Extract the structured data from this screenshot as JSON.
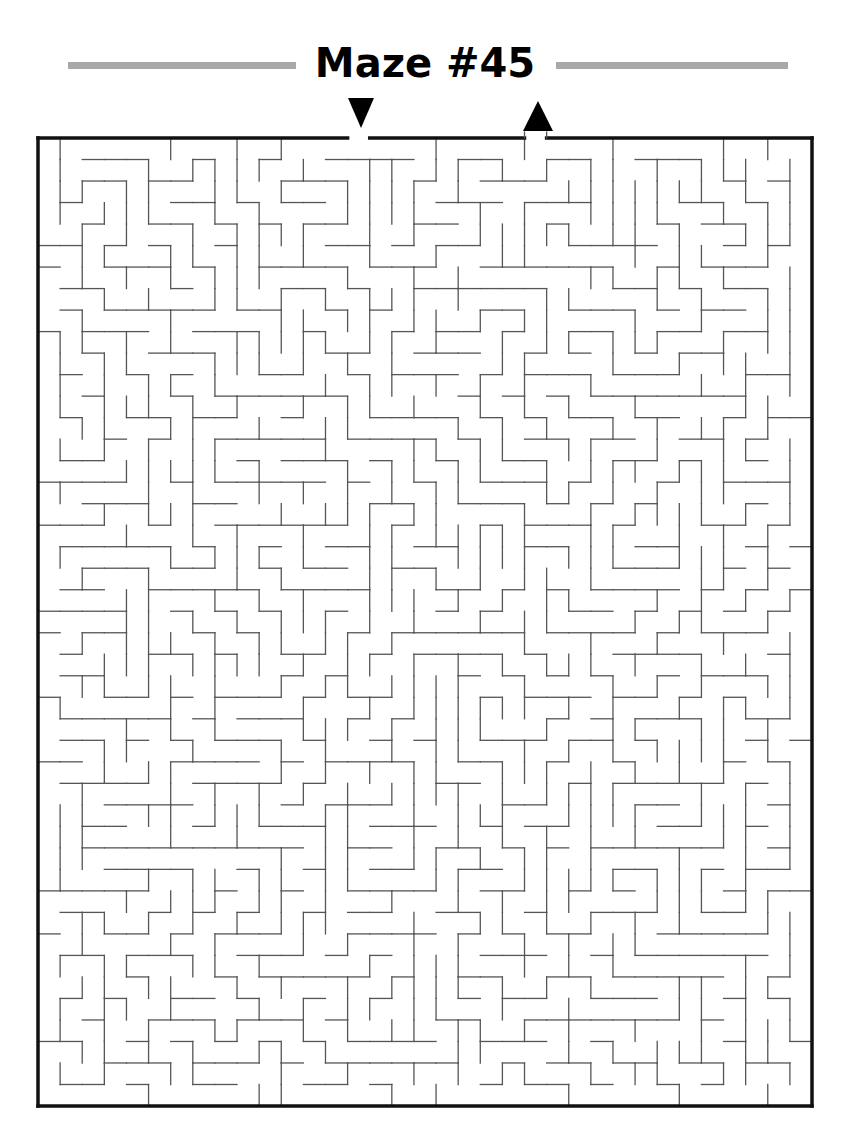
{
  "title": "Maze #45",
  "colors": {
    "title_bar": "#a9a9a9",
    "wall": "#555555",
    "border": "#111111",
    "arrow": "#000000"
  },
  "maze": {
    "cols": 35,
    "rows": 45,
    "box": {
      "x0": 38,
      "y0": 138,
      "x1": 812,
      "y1": 1106
    },
    "entrance": {
      "col": 14,
      "side": "top",
      "marker": "down-arrow"
    },
    "exit": {
      "col": 22,
      "side": "top",
      "marker": "up-arrow"
    },
    "seed": 45
  }
}
